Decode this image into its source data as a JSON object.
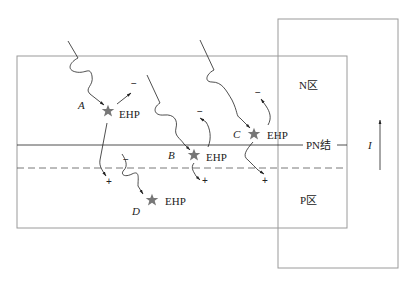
{
  "diagram": {
    "regions": {
      "n_region": "N区",
      "pn_junction": "PN结",
      "p_region": "P区"
    },
    "current_label": "I",
    "events": [
      {
        "id": "A",
        "label": "A",
        "pair": "EHP",
        "minus": "−",
        "plus": "+"
      },
      {
        "id": "B",
        "label": "B",
        "pair": "EHP",
        "minus": "−",
        "plus": "+"
      },
      {
        "id": "C",
        "label": "C",
        "pair": "EHP",
        "minus": "−",
        "plus": "+"
      },
      {
        "id": "D",
        "label": "D",
        "pair": "EHP",
        "minus": "−",
        "plus": ""
      }
    ],
    "colors": {
      "line": "#222222",
      "box": "#9a9a9a",
      "star": "#777777"
    }
  }
}
